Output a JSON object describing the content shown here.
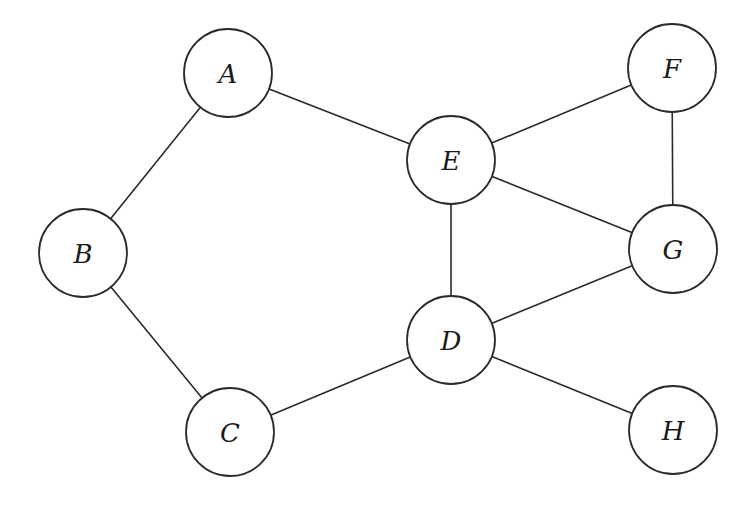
{
  "diagram": {
    "type": "undirected-graph",
    "node_radius": 44,
    "colors": {
      "stroke": "#2a2a2a",
      "fill": "#ffffff",
      "text": "#1a1a1a",
      "background": "#ffffff"
    },
    "nodes": [
      {
        "id": "A",
        "label": "A",
        "x": 228,
        "y": 73
      },
      {
        "id": "B",
        "label": "B",
        "x": 83,
        "y": 253
      },
      {
        "id": "C",
        "label": "C",
        "x": 230,
        "y": 432
      },
      {
        "id": "D",
        "label": "D",
        "x": 451,
        "y": 340
      },
      {
        "id": "E",
        "label": "E",
        "x": 451,
        "y": 160
      },
      {
        "id": "F",
        "label": "F",
        "x": 672,
        "y": 68
      },
      {
        "id": "G",
        "label": "G",
        "x": 673,
        "y": 249
      },
      {
        "id": "H",
        "label": "H",
        "x": 673,
        "y": 430
      }
    ],
    "edges": [
      {
        "from": "A",
        "to": "B"
      },
      {
        "from": "A",
        "to": "E"
      },
      {
        "from": "B",
        "to": "C"
      },
      {
        "from": "C",
        "to": "D"
      },
      {
        "from": "D",
        "to": "E"
      },
      {
        "from": "D",
        "to": "G"
      },
      {
        "from": "D",
        "to": "H"
      },
      {
        "from": "E",
        "to": "F"
      },
      {
        "from": "E",
        "to": "G"
      },
      {
        "from": "F",
        "to": "G"
      }
    ]
  }
}
